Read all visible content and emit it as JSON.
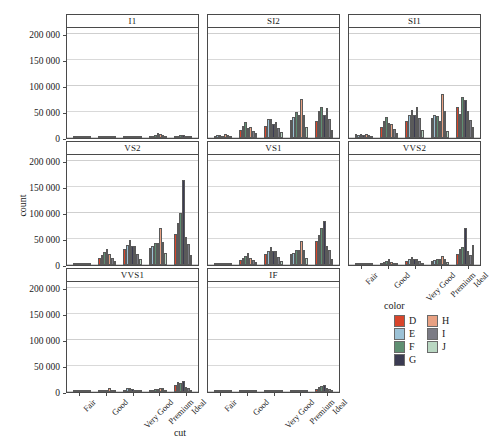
{
  "chart_data": {
    "type": "bar",
    "title": "",
    "subtitle": "",
    "xlabel": "cut",
    "ylabel": "count",
    "ylim": [
      0,
      215000
    ],
    "yticks": [
      0,
      50000,
      100000,
      150000,
      200000
    ],
    "ytick_labels": [
      "0",
      "50 000",
      "100 000",
      "150 000",
      "200 000"
    ],
    "grid": true,
    "legend_position": "bottom-right",
    "legend_title": "color",
    "facet_variable": "clarity",
    "facet_layout": "3 columns x 3 rows",
    "categories": [
      "Fair",
      "Good",
      "Very Good",
      "Premium",
      "Ideal"
    ],
    "series_names": [
      "D",
      "E",
      "F",
      "G",
      "H",
      "I",
      "J"
    ],
    "colors": {
      "D": "#d8452b",
      "E": "#9cc2d6",
      "F": "#5f8f72",
      "G": "#3b3b52",
      "H": "#e8a183",
      "I": "#7b7b85",
      "J": "#b9d7c2"
    },
    "panels": [
      {
        "label": "I1",
        "series": [
          {
            "name": "D",
            "values": [
              1000,
              800,
              1100,
              1800,
              1500
            ]
          },
          {
            "name": "E",
            "values": [
              3000,
              2500,
              3200,
              4500,
              3800
            ]
          },
          {
            "name": "F",
            "values": [
              4000,
              3300,
              4200,
              6500,
              5000
            ]
          },
          {
            "name": "G",
            "values": [
              4500,
              3500,
              4300,
              9200,
              5200
            ]
          },
          {
            "name": "H",
            "values": [
              4200,
              3200,
              4100,
              8000,
              4800
            ]
          },
          {
            "name": "I",
            "values": [
              3500,
              2600,
              3000,
              5200,
              3600
            ]
          },
          {
            "name": "J",
            "values": [
              2000,
              1500,
              1700,
              2800,
              1900
            ]
          }
        ]
      },
      {
        "label": "SI2",
        "series": [
          {
            "name": "D",
            "values": [
              4000,
              15000,
              23000,
              35000,
              32000
            ]
          },
          {
            "name": "E",
            "values": [
              5500,
              23000,
              37000,
              40000,
              52000
            ]
          },
          {
            "name": "F",
            "values": [
              6200,
              31000,
              37000,
              49000,
              59000
            ]
          },
          {
            "name": "G",
            "values": [
              4800,
              19000,
              27000,
              44000,
              44000
            ]
          },
          {
            "name": "H",
            "values": [
              7000,
              22000,
              30000,
              74000,
              58000
            ]
          },
          {
            "name": "I",
            "values": [
              5000,
              14000,
              20000,
              45000,
              37000
            ]
          },
          {
            "name": "J",
            "values": [
              3200,
              9500,
              12000,
              22000,
              16000
            ]
          }
        ]
      },
      {
        "label": "SI1",
        "series": [
          {
            "name": "D",
            "values": [
              7000,
              22000,
              33000,
              39000,
              59000
            ]
          },
          {
            "name": "E",
            "values": [
              6000,
              33000,
              44000,
              44000,
              46000
            ]
          },
          {
            "name": "F",
            "values": [
              7500,
              41000,
              53000,
              43000,
              78000
            ]
          },
          {
            "name": "G",
            "values": [
              5200,
              29000,
              44000,
              33000,
              73000
            ]
          },
          {
            "name": "H",
            "values": [
              7800,
              27000,
              59000,
              85000,
              51000
            ]
          },
          {
            "name": "I",
            "values": [
              5000,
              18000,
              38000,
              52000,
              34000
            ]
          },
          {
            "name": "J",
            "values": [
              2200,
              10000,
              16000,
              13000,
              22000
            ]
          }
        ]
      },
      {
        "label": "VS2",
        "series": [
          {
            "name": "D",
            "values": [
              4000,
              14000,
              31000,
              33000,
              59000
            ]
          },
          {
            "name": "E",
            "values": [
              3500,
              20000,
              38000,
              36000,
              80000
            ]
          },
          {
            "name": "F",
            "values": [
              3800,
              25000,
              48000,
              42000,
              100000
            ]
          },
          {
            "name": "G",
            "values": [
              4200,
              31000,
              36000,
              43000,
              163000
            ]
          },
          {
            "name": "H",
            "values": [
              3600,
              21000,
              37000,
              72000,
              53000
            ]
          },
          {
            "name": "I",
            "values": [
              2800,
              14000,
              22000,
              45000,
              41000
            ]
          },
          {
            "name": "J",
            "values": [
              1600,
              7000,
              11000,
              23000,
              19000
            ]
          }
        ]
      },
      {
        "label": "VS1",
        "series": [
          {
            "name": "D",
            "values": [
              2800,
              10000,
              21000,
              22000,
              46000
            ]
          },
          {
            "name": "E",
            "values": [
              2200,
              14000,
              27000,
              23000,
              57000
            ]
          },
          {
            "name": "F",
            "values": [
              2400,
              18000,
              35000,
              28000,
              71000
            ]
          },
          {
            "name": "G",
            "values": [
              3000,
              23000,
              26000,
              29000,
              85000
            ]
          },
          {
            "name": "H",
            "values": [
              2000,
              13000,
              26000,
              46000,
              37000
            ]
          },
          {
            "name": "I",
            "values": [
              1500,
              9000,
              16000,
              28000,
              28000
            ]
          },
          {
            "name": "J",
            "values": [
              900,
              5000,
              8000,
              13000,
              12000
            ]
          }
        ]
      },
      {
        "label": "VVS2",
        "series": [
          {
            "name": "D",
            "values": [
              800,
              4500,
              8000,
              8000,
              22000
            ]
          },
          {
            "name": "E",
            "values": [
              600,
              6500,
              12000,
              9500,
              30000
            ]
          },
          {
            "name": "F",
            "values": [
              700,
              8500,
              15000,
              11000,
              35000
            ]
          },
          {
            "name": "G",
            "values": [
              900,
              11000,
              12000,
              12000,
              71000
            ]
          },
          {
            "name": "H",
            "values": [
              500,
              5500,
              11000,
              17000,
              26000
            ]
          },
          {
            "name": "I",
            "values": [
              300,
              3500,
              7000,
              11000,
              19000
            ]
          },
          {
            "name": "J",
            "values": [
              200,
              1800,
              3500,
              5500,
              38000
            ]
          }
        ]
      },
      {
        "label": "VVS1",
        "series": [
          {
            "name": "D",
            "values": [
              400,
              2500,
              4500,
              3800,
              14000
            ]
          },
          {
            "name": "E",
            "values": [
              300,
              3500,
              7000,
              4500,
              20000
            ]
          },
          {
            "name": "F",
            "values": [
              350,
              4500,
              8500,
              5500,
              17000
            ]
          },
          {
            "name": "G",
            "values": [
              300,
              3500,
              5500,
              5500,
              21000
            ]
          },
          {
            "name": "H",
            "values": [
              250,
              7500,
              4500,
              7500,
              9000
            ]
          },
          {
            "name": "I",
            "values": [
              150,
              2500,
              4000,
              7000,
              8000
            ]
          },
          {
            "name": "J",
            "values": [
              100,
              900,
              1500,
              2500,
              2500
            ]
          }
        ]
      },
      {
        "label": "IF",
        "series": [
          {
            "name": "D",
            "values": [
              100,
              700,
              1400,
              900,
              6000
            ]
          },
          {
            "name": "E",
            "values": [
              80,
              1000,
              2500,
              1200,
              9000
            ]
          },
          {
            "name": "F",
            "values": [
              90,
              1300,
              3200,
              1600,
              11000
            ]
          },
          {
            "name": "G",
            "values": [
              70,
              1000,
              2000,
              1800,
              14000
            ]
          },
          {
            "name": "H",
            "values": [
              60,
              700,
              1500,
              2200,
              7500
            ]
          },
          {
            "name": "I",
            "values": [
              40,
              500,
              1100,
              1700,
              5500
            ]
          },
          {
            "name": "J",
            "values": [
              20,
              200,
              400,
              600,
              1200
            ]
          }
        ]
      }
    ]
  },
  "axes": {
    "y_title": "count",
    "x_title": "cut",
    "y_tick_labels": [
      "200 000",
      "150 000",
      "100 000",
      "50 000",
      "0"
    ],
    "x_tick_labels": [
      "Fair",
      "Good",
      "Very Good",
      "Premium",
      "Ideal"
    ]
  },
  "legend": {
    "title": "color",
    "column_one": [
      {
        "label": "D",
        "color": "#d8452b"
      },
      {
        "label": "E",
        "color": "#9cc2d6"
      },
      {
        "label": "F",
        "color": "#5f8f72"
      },
      {
        "label": "G",
        "color": "#3b3b52"
      }
    ],
    "column_two": [
      {
        "label": "H",
        "color": "#e8a183"
      },
      {
        "label": "I",
        "color": "#7b7b85"
      },
      {
        "label": "J",
        "color": "#b9d7c2"
      }
    ]
  },
  "facet_labels": [
    "I1",
    "SI2",
    "SI1",
    "VS2",
    "VS1",
    "VVS2",
    "VVS1",
    "IF"
  ]
}
